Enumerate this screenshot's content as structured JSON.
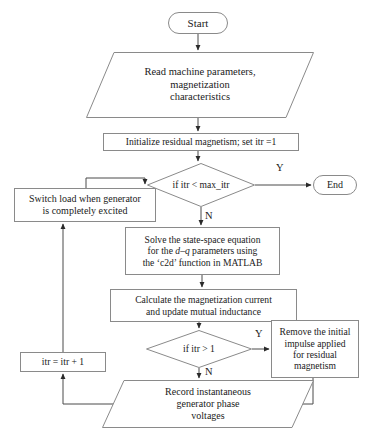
{
  "diagram": {
    "type": "flowchart",
    "stroke_color": "#8a8a8a",
    "text_color": "#1a1a1a",
    "background_color": "#ffffff",
    "nodes": [
      {
        "id": "start",
        "shape": "terminator",
        "label": "Start",
        "x": 168,
        "y": 12,
        "w": 60,
        "h": 22,
        "font_size": 11
      },
      {
        "id": "read_params",
        "shape": "parallelogram",
        "label": "Read machine parameters,\nmagnetization\ncharacteristics",
        "x": 86,
        "y": 52,
        "w": 228,
        "h": 66,
        "skew": 28,
        "font_size": 10.5
      },
      {
        "id": "init_residual",
        "shape": "process",
        "label": "Initialize residual magnetism; set itr =1",
        "x": 103,
        "y": 133,
        "w": 196,
        "h": 18,
        "font_size": 9.6
      },
      {
        "id": "check_max_itr",
        "shape": "decision",
        "label": "if itr < max_itr",
        "x": 147,
        "y": 163,
        "w": 108,
        "h": 44,
        "font_size": 9.6
      },
      {
        "id": "end",
        "shape": "terminator",
        "label": "End",
        "x": 313,
        "y": 175,
        "w": 44,
        "h": 20,
        "font_size": 10
      },
      {
        "id": "switch_load",
        "shape": "process",
        "label": "Switch load when generator\nis completely excited",
        "x": 14,
        "y": 188,
        "w": 142,
        "h": 34,
        "font_size": 10
      },
      {
        "id": "solve_state_space",
        "shape": "process",
        "label": "Solve the state-space equation\nfor the d–q parameters using\nthe ‘c2d’ function in MATLAB",
        "rich": true,
        "x": 125,
        "y": 227,
        "w": 155,
        "h": 48,
        "font_size": 9.6
      },
      {
        "id": "calc_magnetization",
        "shape": "process",
        "label": "Calculate the magnetization current\nand update mutual inductance",
        "x": 110,
        "y": 289,
        "w": 187,
        "h": 33,
        "font_size": 9.6
      },
      {
        "id": "check_itr_gt1",
        "shape": "decision",
        "label": "if itr > 1",
        "x": 146,
        "y": 330,
        "w": 106,
        "h": 38,
        "font_size": 9.6
      },
      {
        "id": "remove_impulse",
        "shape": "process",
        "label": "Remove the initial\nimpulse applied\nfor residual\nmagnetism",
        "x": 271,
        "y": 320,
        "w": 88,
        "h": 58,
        "font_size": 9.6
      },
      {
        "id": "increment_itr",
        "shape": "process",
        "label": "itr = itr + 1",
        "x": 20,
        "y": 352,
        "w": 86,
        "h": 20,
        "font_size": 9.6
      },
      {
        "id": "record_voltages",
        "shape": "parallelogram",
        "label": "Record instantaneous\ngenerator phase\nvoltages",
        "x": 102,
        "y": 380,
        "w": 212,
        "h": 48,
        "skew": 22,
        "font_size": 10
      }
    ],
    "edge_labels": [
      {
        "id": "yes-max-itr",
        "text": "Y",
        "x": 276,
        "y": 163,
        "font_size": 10.5
      },
      {
        "id": "no-max-itr",
        "text": "N",
        "x": 205,
        "y": 211,
        "font_size": 10.5
      },
      {
        "id": "yes-itr-gt1",
        "text": "Y",
        "x": 255,
        "y": 329,
        "font_size": 10.5
      },
      {
        "id": "no-itr-gt1",
        "text": "N",
        "x": 205,
        "y": 367,
        "font_size": 10.5
      }
    ],
    "connectors": [
      {
        "id": "start-to-read",
        "from": "start",
        "to": "read_params",
        "points": "198,34 198,50",
        "arrow": true
      },
      {
        "id": "read-to-init",
        "from": "read_params",
        "to": "init_residual",
        "points": "198,118 198,131",
        "arrow": true
      },
      {
        "id": "init-to-check",
        "from": "init_residual",
        "to": "check_max_itr",
        "points": "198,151 198,161",
        "arrow": true
      },
      {
        "id": "check-yes-to-end",
        "from": "check_max_itr",
        "to": "end",
        "points": "255,185 311,185",
        "arrow": true
      },
      {
        "id": "check-no-to-solve",
        "from": "check_max_itr",
        "to": "solve_state_space",
        "points": "201,207 201,225",
        "arrow": true
      },
      {
        "id": "switch-load-to-check",
        "from": "switch_load",
        "to": "check_max_itr",
        "points": "86,188 86,178 145,178 145,184",
        "arrow": true
      },
      {
        "id": "solve-to-calc",
        "from": "solve_state_space",
        "to": "calc_magnetization",
        "points": "202,275 202,287",
        "arrow": true
      },
      {
        "id": "calc-to-check2",
        "from": "calc_magnetization",
        "to": "check_itr_gt1",
        "points": "199,322 199,328",
        "arrow": true
      },
      {
        "id": "check2-yes-to-remove",
        "from": "check_itr_gt1",
        "to": "remove_impulse",
        "points": "252,349 269,349",
        "arrow": true
      },
      {
        "id": "check2-no-to-record",
        "from": "check_itr_gt1",
        "to": "record_voltages",
        "points": "199,368 199,378",
        "arrow": true
      },
      {
        "id": "remove-to-record",
        "from": "remove_impulse",
        "to": "record_voltages",
        "points": "313,378 313,404 289,404",
        "arrow": true
      },
      {
        "id": "record-to-increment",
        "from": "record_voltages",
        "to": "increment_itr",
        "points": "119,404 63,404 63,374",
        "arrow": true
      },
      {
        "id": "increment-to-switch-load",
        "from": "increment_itr",
        "to": "switch_load",
        "points": "63,352 63,224",
        "arrow": true
      }
    ]
  }
}
